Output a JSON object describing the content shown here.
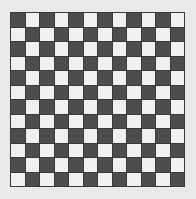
{
  "board": {
    "name": "checkerboard",
    "columns": 12,
    "rows": 12,
    "cell_size_px": 13.6,
    "gridline_width_px": 1,
    "origin_x_px": 10,
    "origin_y_px": 12,
    "width_px": 175,
    "height_px": 175,
    "top_left_cell": "dark",
    "colors": {
      "page_background": "#e9e9e9",
      "dark_cell": "#4d4d4d",
      "light_cell": "#f0f0f0",
      "gridline": "#3a3a3a"
    },
    "cells": [
      [
        "dark",
        "light",
        "dark",
        "light",
        "dark",
        "light",
        "dark",
        "light",
        "dark",
        "light",
        "dark",
        "light"
      ],
      [
        "light",
        "dark",
        "light",
        "dark",
        "light",
        "dark",
        "light",
        "dark",
        "light",
        "dark",
        "light",
        "dark"
      ],
      [
        "dark",
        "light",
        "dark",
        "light",
        "dark",
        "light",
        "dark",
        "light",
        "dark",
        "light",
        "dark",
        "light"
      ],
      [
        "light",
        "dark",
        "light",
        "dark",
        "light",
        "dark",
        "light",
        "dark",
        "light",
        "dark",
        "light",
        "dark"
      ],
      [
        "dark",
        "light",
        "dark",
        "light",
        "dark",
        "light",
        "dark",
        "light",
        "dark",
        "light",
        "dark",
        "light"
      ],
      [
        "light",
        "dark",
        "light",
        "dark",
        "light",
        "dark",
        "light",
        "dark",
        "light",
        "dark",
        "light",
        "dark"
      ],
      [
        "dark",
        "light",
        "dark",
        "light",
        "dark",
        "light",
        "dark",
        "light",
        "dark",
        "light",
        "dark",
        "light"
      ],
      [
        "light",
        "dark",
        "light",
        "dark",
        "light",
        "dark",
        "light",
        "dark",
        "light",
        "dark",
        "light",
        "dark"
      ],
      [
        "dark",
        "light",
        "dark",
        "light",
        "dark",
        "light",
        "dark",
        "light",
        "dark",
        "light",
        "dark",
        "light"
      ],
      [
        "light",
        "dark",
        "light",
        "dark",
        "light",
        "dark",
        "light",
        "dark",
        "light",
        "dark",
        "light",
        "dark"
      ],
      [
        "dark",
        "light",
        "dark",
        "light",
        "dark",
        "light",
        "dark",
        "light",
        "dark",
        "light",
        "dark",
        "light"
      ],
      [
        "light",
        "dark",
        "light",
        "dark",
        "light",
        "dark",
        "light",
        "dark",
        "light",
        "dark",
        "light",
        "dark"
      ]
    ]
  }
}
